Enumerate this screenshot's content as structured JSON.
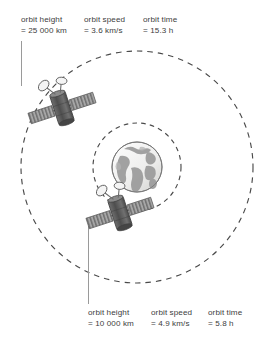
{
  "diagram": {
    "type": "satellite-orbit-diagram",
    "title": "",
    "center_body": {
      "name": "earth",
      "label": ""
    },
    "orbits": [
      {
        "id": "outer-orbit",
        "style": "dashed",
        "annotation_position": "top",
        "labels": {
          "height_label": "orbit height",
          "height_value": "= 25 000 km",
          "speed_label": "orbit speed",
          "speed_value": "= 3.6 km/s",
          "time_label": "orbit time",
          "time_value": "= 15.3 h"
        }
      },
      {
        "id": "inner-orbit",
        "style": "dashed",
        "annotation_position": "bottom",
        "labels": {
          "height_label": "orbit height",
          "height_value": "= 10 000 km",
          "speed_label": "orbit speed",
          "speed_value": "= 4.9 km/s",
          "time_label": "orbit time",
          "time_value": "= 5.8 h"
        }
      }
    ],
    "satellites": [
      {
        "id": "outer-satellite",
        "orbit": "outer-orbit"
      },
      {
        "id": "inner-satellite",
        "orbit": "inner-orbit"
      }
    ],
    "footer_text": "",
    "colors": {
      "line": "#4a4a4a",
      "text": "#404040",
      "ocean": "#f0f0ee",
      "land": "#9a9a9a",
      "panel": "#8e8e8e",
      "body": "#5d5d5d",
      "background": "#ffffff"
    }
  }
}
